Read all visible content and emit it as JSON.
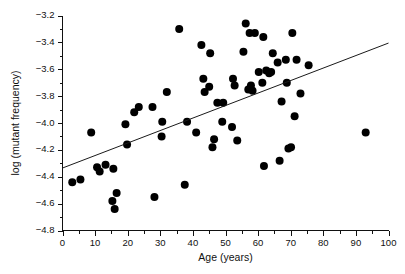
{
  "chart_data": {
    "type": "scatter",
    "title": "",
    "xlabel": "Age (years)",
    "ylabel": "log (mutant frequency)",
    "xlim": [
      0,
      100
    ],
    "ylim": [
      -4.8,
      -3.2
    ],
    "grid": false,
    "legend": null,
    "x_ticks": [
      0,
      10,
      20,
      30,
      40,
      50,
      60,
      70,
      80,
      90,
      100
    ],
    "x_tick_labels": [
      "0",
      "10",
      "20",
      "30",
      "40",
      "50",
      "60",
      "70",
      "80",
      "90",
      "100"
    ],
    "x_minor_ticks": [
      5,
      15,
      25,
      35,
      45,
      55,
      65,
      75,
      85,
      95
    ],
    "y_ticks": [
      -3.2,
      -3.4,
      -3.6,
      -3.8,
      -4.0,
      -4.2,
      -4.4,
      -4.6,
      -4.8
    ],
    "y_tick_labels": [
      "−3.2",
      "−3.4",
      "−3.6",
      "−3.8",
      "−4.0",
      "−4.2",
      "−4.4",
      "−4.6",
      "−4.8"
    ],
    "y_minor_ticks": [
      -3.3,
      -3.5,
      -3.7,
      -3.9,
      -4.1,
      -4.3,
      -4.5,
      -4.7
    ],
    "marker": {
      "shape": "circle",
      "color": "#000000",
      "size_px": 5.2
    },
    "series": [
      {
        "name": "mutant frequency vs age",
        "points": [
          [
            3.0,
            -4.44
          ],
          [
            5.5,
            -4.42
          ],
          [
            8.8,
            -4.07
          ],
          [
            10.6,
            -4.33
          ],
          [
            11.4,
            -4.36
          ],
          [
            13.2,
            -4.31
          ],
          [
            15.3,
            -4.58
          ],
          [
            15.6,
            -4.34
          ],
          [
            16.0,
            -4.64
          ],
          [
            16.6,
            -4.52
          ],
          [
            19.3,
            -4.01
          ],
          [
            19.8,
            -4.16
          ],
          [
            22.0,
            -3.92
          ],
          [
            23.4,
            -3.88
          ],
          [
            27.6,
            -3.88
          ],
          [
            28.2,
            -4.55
          ],
          [
            30.4,
            -4.1
          ],
          [
            30.6,
            -3.99
          ],
          [
            32.0,
            -3.77
          ],
          [
            35.8,
            -3.3
          ],
          [
            37.5,
            -4.46
          ],
          [
            38.2,
            -3.99
          ],
          [
            41.0,
            -4.07
          ],
          [
            42.6,
            -3.42
          ],
          [
            43.2,
            -3.67
          ],
          [
            43.6,
            -3.77
          ],
          [
            45.0,
            -3.73
          ],
          [
            45.3,
            -3.48
          ],
          [
            46.0,
            -4.18
          ],
          [
            46.5,
            -4.12
          ],
          [
            47.5,
            -3.85
          ],
          [
            49.0,
            -3.99
          ],
          [
            49.3,
            -3.85
          ],
          [
            52.0,
            -4.03
          ],
          [
            52.3,
            -3.67
          ],
          [
            52.8,
            -3.72
          ],
          [
            53.6,
            -4.13
          ],
          [
            55.5,
            -3.47
          ],
          [
            56.2,
            -3.26
          ],
          [
            57.0,
            -3.75
          ],
          [
            57.4,
            -3.33
          ],
          [
            57.8,
            -3.72
          ],
          [
            58.3,
            -3.76
          ],
          [
            59.0,
            -3.33
          ],
          [
            60.2,
            -3.62
          ],
          [
            61.3,
            -3.7
          ],
          [
            61.6,
            -3.36
          ],
          [
            61.8,
            -4.32
          ],
          [
            62.5,
            -3.61
          ],
          [
            63.4,
            -3.63
          ],
          [
            64.0,
            -3.62
          ],
          [
            64.5,
            -3.48
          ],
          [
            66.0,
            -3.55
          ],
          [
            66.6,
            -4.28
          ],
          [
            67.2,
            -3.84
          ],
          [
            68.5,
            -3.53
          ],
          [
            68.8,
            -3.7
          ],
          [
            69.3,
            -4.19
          ],
          [
            70.1,
            -4.18
          ],
          [
            70.5,
            -3.33
          ],
          [
            71.2,
            -3.95
          ],
          [
            71.8,
            -3.53
          ],
          [
            73.0,
            -3.78
          ],
          [
            75.5,
            -3.57
          ],
          [
            93.0,
            -4.07
          ]
        ]
      }
    ],
    "fit_line": {
      "type": "linear-regression",
      "x_start": 0,
      "y_start": -4.335,
      "x_end": 100,
      "y_end": -3.405
    }
  }
}
